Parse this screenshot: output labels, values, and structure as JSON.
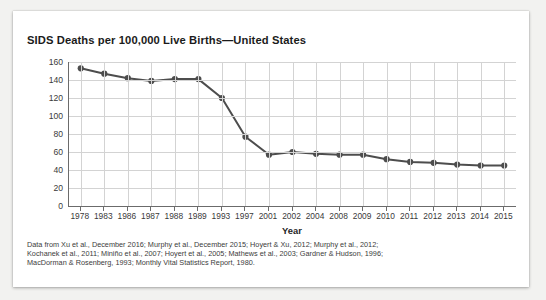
{
  "card": {
    "title": "SIDS Deaths per 100,000 Live Births—United States"
  },
  "footnote": {
    "line1": "Data from Xu et al., December 2016; Murphy et al., December 2015; Hoyert & Xu, 2012; Murphy et al., 2012;",
    "line2": "Kochanek et al., 2011; Miniño et al., 2007; Hoyert et al., 2005; Mathews et al., 2003; Gardner & Hudson, 1996;",
    "line3": "MacDorman & Rosenberg, 1993; Monthly Vital Statistics Report, 1980."
  },
  "chart_data": {
    "type": "line",
    "title": "SIDS Deaths per 100,000 Live Births—United States",
    "xlabel": "Year",
    "ylabel": "",
    "ylim": [
      0,
      160
    ],
    "ytick_step": 20,
    "yticks": [
      0,
      20,
      40,
      60,
      80,
      100,
      120,
      140,
      160
    ],
    "grid": true,
    "legend": "none",
    "line_color": "#4d4d4d",
    "marker_color": "#4d4d4d",
    "categories": [
      "1978",
      "1983",
      "1986",
      "1987",
      "1988",
      "1989",
      "1993",
      "1997",
      "2001",
      "2002",
      "2004",
      "2008",
      "2009",
      "2010",
      "2011",
      "2012",
      "2013",
      "2014",
      "2015"
    ],
    "values": [
      153,
      147,
      142,
      139,
      141,
      141,
      120,
      77,
      57,
      60,
      58,
      57,
      57,
      52,
      49,
      48,
      46,
      45,
      45
    ]
  }
}
